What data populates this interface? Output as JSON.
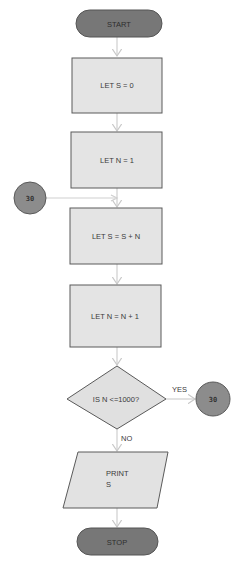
{
  "diagram": {
    "type": "flowchart",
    "colors": {
      "terminal_fill": "#777777",
      "process_fill": "#e4e4e4",
      "connector_fill": "#8c8c8c",
      "stroke": "#5a5a5a",
      "arrow": "#c8c8c8"
    },
    "nodes": {
      "start": {
        "shape": "terminal",
        "label": "START"
      },
      "let_s_0": {
        "shape": "process",
        "label": "LET S = 0"
      },
      "let_n_1": {
        "shape": "process",
        "label": "LET N = 1"
      },
      "let_s_sn": {
        "shape": "process",
        "label": "LET S = S + N"
      },
      "let_n_n1": {
        "shape": "process",
        "label": "LET N = N + 1"
      },
      "decision": {
        "shape": "decision",
        "label": "IS N <=1000?"
      },
      "print": {
        "shape": "io",
        "label_line1": "PRINT",
        "label_line2": "S"
      },
      "stop": {
        "shape": "terminal",
        "label": "STOP"
      },
      "connector_in": {
        "shape": "connector",
        "label": "30"
      },
      "connector_out": {
        "shape": "connector",
        "label": "30"
      }
    },
    "edges": {
      "yes_label": "YES",
      "no_label": "NO"
    }
  }
}
